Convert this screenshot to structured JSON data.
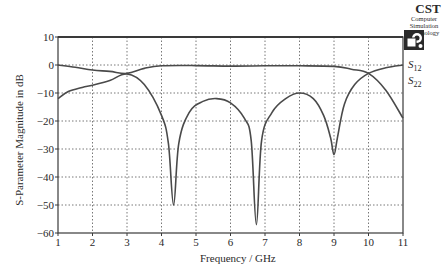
{
  "logo": {
    "title": "CST",
    "subtitle_line1": "Computer Simulation",
    "subtitle_line2": "Technology"
  },
  "chart_data": {
    "type": "line",
    "title": "",
    "xlabel": "Frequency / GHz",
    "ylabel": "S-Parameter Magnitude in dB",
    "xlim": [
      1,
      11
    ],
    "ylim": [
      -60,
      10
    ],
    "xticks": [
      1,
      2,
      3,
      4,
      5,
      6,
      7,
      8,
      9,
      10,
      11
    ],
    "yticks": [
      10,
      0,
      -10,
      -20,
      -30,
      -40,
      -50,
      -60
    ],
    "ytick_labels": [
      "10",
      "0",
      "−10",
      "−20",
      "−30",
      "−40",
      "−50",
      "−60"
    ],
    "grid": true,
    "legend_position": "right",
    "series": [
      {
        "name": "S12",
        "label_main": "S",
        "label_sub": "12",
        "x": [
          1,
          1.5,
          2,
          2.5,
          3,
          3.5,
          4,
          5,
          6,
          7,
          8,
          9,
          9.5,
          10,
          10.5,
          11
        ],
        "values": [
          0,
          -0.8,
          -1.8,
          -2.3,
          -3,
          -1.2,
          -0.3,
          -0.2,
          -0.4,
          -0.3,
          -0.3,
          -0.5,
          -1.5,
          -3,
          -9,
          -19
        ]
      },
      {
        "name": "S22",
        "label_main": "S",
        "label_sub": "22",
        "x": [
          1,
          1.3,
          1.7,
          2,
          2.5,
          3,
          3.5,
          4,
          4.2,
          4.35,
          4.5,
          4.8,
          5.2,
          5.6,
          6,
          6.4,
          6.6,
          6.75,
          6.9,
          7.2,
          7.6,
          8,
          8.4,
          8.7,
          8.9,
          9.0,
          9.1,
          9.3,
          9.6,
          10,
          10.5,
          11
        ],
        "values": [
          -12,
          -9.5,
          -8,
          -7.2,
          -5.5,
          -3.2,
          -7,
          -18,
          -28,
          -50,
          -28,
          -17,
          -13,
          -12,
          -13.5,
          -19,
          -27,
          -57,
          -27,
          -17,
          -12,
          -10,
          -12,
          -18,
          -26,
          -32,
          -26,
          -14,
          -7,
          -3,
          -1,
          0
        ]
      }
    ]
  }
}
